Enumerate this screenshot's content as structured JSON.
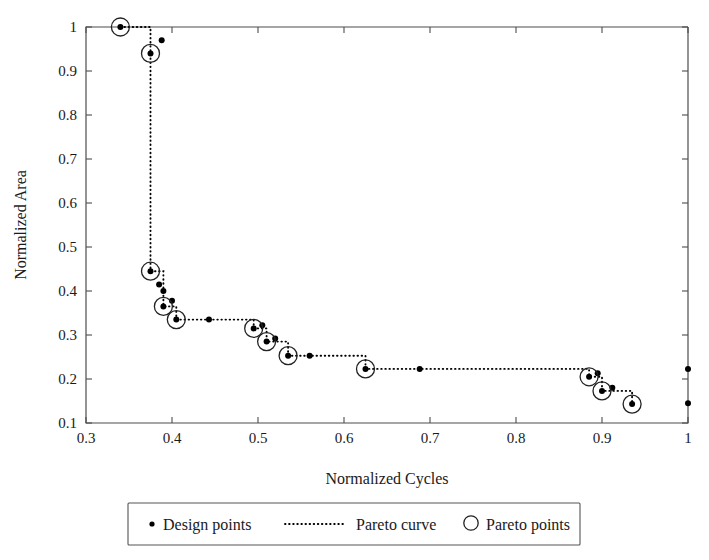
{
  "chart_data": {
    "type": "scatter",
    "title": "",
    "xlabel": "Normalized Cycles",
    "ylabel": "Normalized Area",
    "xlim": [
      0.3,
      1.0
    ],
    "ylim": [
      0.1,
      1.0
    ],
    "grid": false,
    "xticks": [
      "0.3",
      "0.4",
      "0.5",
      "0.6",
      "0.7",
      "0.8",
      "0.9",
      "1"
    ],
    "xtick_values": [
      0.3,
      0.4,
      0.5,
      0.6,
      0.7,
      0.8,
      0.9,
      1.0
    ],
    "yticks": [
      "0.1",
      "0.2",
      "0.3",
      "0.4",
      "0.5",
      "0.6",
      "0.7",
      "0.8",
      "0.9",
      "1"
    ],
    "ytick_values": [
      0.1,
      0.2,
      0.3,
      0.4,
      0.5,
      0.6,
      0.7,
      0.8,
      0.9,
      1.0
    ],
    "legend_position": "below-plot",
    "legend": [
      {
        "key": "design-points",
        "label": "Design points",
        "marker": "dot"
      },
      {
        "key": "pareto-curve",
        "label": "Pareto curve",
        "marker": "dotted-line"
      },
      {
        "key": "pareto-points",
        "label": "Pareto points",
        "marker": "open-circle"
      }
    ],
    "series": [
      {
        "name": "Design points",
        "marker": "dot",
        "points": [
          [
            0.34,
            1.0
          ],
          [
            0.375,
            0.94
          ],
          [
            0.388,
            0.97
          ],
          [
            0.375,
            0.445
          ],
          [
            0.385,
            0.415
          ],
          [
            0.39,
            0.4
          ],
          [
            0.39,
            0.365
          ],
          [
            0.4,
            0.378
          ],
          [
            0.405,
            0.335
          ],
          [
            0.443,
            0.335
          ],
          [
            0.495,
            0.315
          ],
          [
            0.505,
            0.322
          ],
          [
            0.51,
            0.285
          ],
          [
            0.52,
            0.292
          ],
          [
            0.535,
            0.253
          ],
          [
            0.56,
            0.253
          ],
          [
            0.625,
            0.223
          ],
          [
            0.688,
            0.223
          ],
          [
            0.885,
            0.205
          ],
          [
            0.895,
            0.213
          ],
          [
            0.9,
            0.173
          ],
          [
            0.912,
            0.18
          ],
          [
            0.935,
            0.143
          ],
          [
            1.0,
            0.223
          ],
          [
            1.0,
            0.145
          ]
        ]
      },
      {
        "name": "Pareto points",
        "marker": "open-circle",
        "points": [
          [
            0.34,
            1.0
          ],
          [
            0.375,
            0.94
          ],
          [
            0.375,
            0.445
          ],
          [
            0.39,
            0.365
          ],
          [
            0.405,
            0.335
          ],
          [
            0.495,
            0.315
          ],
          [
            0.51,
            0.285
          ],
          [
            0.535,
            0.253
          ],
          [
            0.625,
            0.223
          ],
          [
            0.885,
            0.205
          ],
          [
            0.9,
            0.173
          ],
          [
            0.935,
            0.143
          ]
        ]
      }
    ],
    "pareto_curve": {
      "name": "Pareto curve",
      "style": "dotted-staircase",
      "vertices": [
        [
          0.34,
          1.0
        ],
        [
          0.375,
          1.0
        ],
        [
          0.375,
          0.94
        ],
        [
          0.375,
          0.445
        ],
        [
          0.39,
          0.445
        ],
        [
          0.39,
          0.365
        ],
        [
          0.405,
          0.365
        ],
        [
          0.405,
          0.335
        ],
        [
          0.495,
          0.335
        ],
        [
          0.495,
          0.315
        ],
        [
          0.51,
          0.315
        ],
        [
          0.51,
          0.285
        ],
        [
          0.535,
          0.285
        ],
        [
          0.535,
          0.253
        ],
        [
          0.625,
          0.253
        ],
        [
          0.625,
          0.223
        ],
        [
          0.885,
          0.223
        ],
        [
          0.885,
          0.205
        ],
        [
          0.9,
          0.205
        ],
        [
          0.9,
          0.173
        ],
        [
          0.935,
          0.173
        ],
        [
          0.935,
          0.143
        ]
      ]
    },
    "colors": {
      "marker": "#000000",
      "axis": "#4d4d4d",
      "curve": "#000000",
      "background": "#ffffff"
    }
  }
}
